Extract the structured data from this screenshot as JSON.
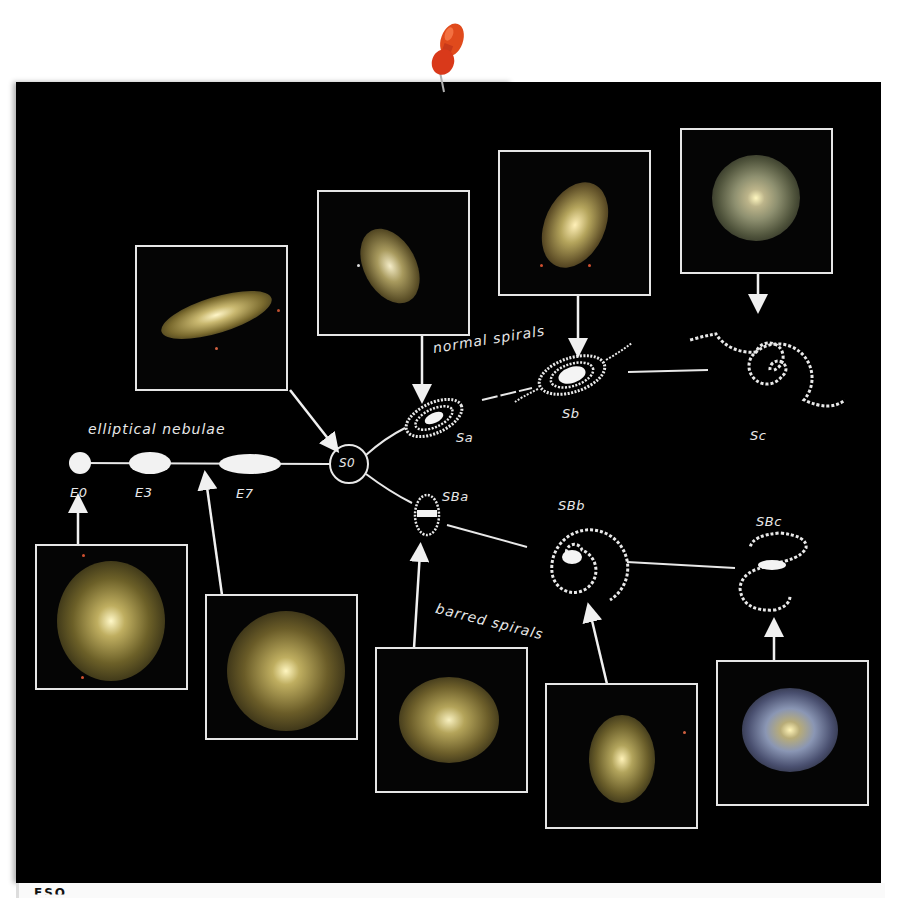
{
  "diagram": {
    "type": "Hubble tuning fork",
    "background_color": "#000000",
    "accent_color": "#e8e8e8",
    "pin_color": "#d9391a",
    "branches": {
      "elliptical": {
        "label": "elliptical nebulae",
        "stages": [
          "E0",
          "E3",
          "E7"
        ]
      },
      "junction": {
        "label": "S0"
      },
      "normal": {
        "label": "normal spirals",
        "stages": [
          "Sa",
          "Sb",
          "Sc"
        ]
      },
      "barred": {
        "label": "barred spirals",
        "stages": [
          "SBa",
          "SBb",
          "SBc"
        ]
      }
    },
    "photo_panels": [
      {
        "id": "E0",
        "points_to": "E0"
      },
      {
        "id": "E-mid",
        "points_to": "E3-E7 connector"
      },
      {
        "id": "S0",
        "points_to": "S0"
      },
      {
        "id": "Sa",
        "points_to": "Sa"
      },
      {
        "id": "Sb",
        "points_to": "Sb"
      },
      {
        "id": "Sc",
        "points_to": "Sc"
      },
      {
        "id": "SBa",
        "points_to": "SBa"
      },
      {
        "id": "SBb",
        "points_to": "SBb"
      },
      {
        "id": "SBc",
        "points_to": "SBc"
      }
    ],
    "caption_partial": "ESO"
  }
}
